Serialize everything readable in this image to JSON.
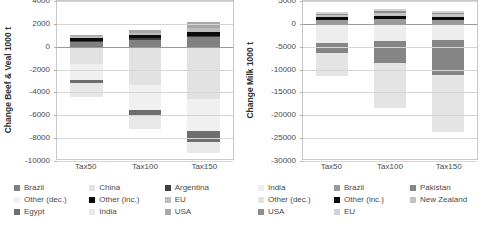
{
  "chart_data": [
    {
      "id": "beef-veal",
      "type": "bar",
      "stacked": true,
      "title": "",
      "xlabel": "",
      "ylabel": "Change Beef & Veal 1000 t",
      "categories": [
        "Tax50",
        "Tax100",
        "Tax150"
      ],
      "ylim": [
        -10000,
        4000
      ],
      "yticks": [
        4000,
        2000,
        0,
        -2000,
        -4000,
        -6000,
        -8000,
        -10000
      ],
      "grid": true,
      "legend_position": "bottom",
      "series": [
        {
          "name": "Brazil",
          "color": "#808080",
          "values": [
            400,
            620,
            840
          ]
        },
        {
          "name": "China",
          "color": "#e2e2e2",
          "values": [
            -1500,
            -3350,
            -4550
          ]
        },
        {
          "name": "Argentina",
          "color": "#3f3f3f",
          "values": [
            140,
            130,
            120
          ]
        },
        {
          "name": "Other (dec.)",
          "color": "#f0f0f0",
          "values": [
            -1450,
            -2150,
            -2850
          ]
        },
        {
          "name": "Other (inc.)",
          "color": "#0a0a0a",
          "values": [
            260,
            300,
            330
          ]
        },
        {
          "name": "EU",
          "color": "#bdbdbd",
          "values": [
            120,
            180,
            330
          ]
        },
        {
          "name": "Egypt",
          "color": "#6e6e6e",
          "values": [
            -200,
            -550,
            -950
          ]
        },
        {
          "name": "India",
          "color": "#e8e8e8",
          "values": [
            -1250,
            -1150,
            -950
          ]
        },
        {
          "name": "USA",
          "color": "#a8a8a8",
          "values": [
            80,
            220,
            550
          ]
        }
      ],
      "positive_order": [
        "Brazil",
        "Argentina",
        "Other (inc.)",
        "EU",
        "USA"
      ],
      "negative_order": [
        "China",
        "Other (dec.)",
        "Egypt",
        "India"
      ]
    },
    {
      "id": "milk",
      "type": "bar",
      "stacked": true,
      "title": "",
      "xlabel": "",
      "ylabel": "Change Milk 1000 t",
      "categories": [
        "Tax50",
        "Tax100",
        "Tax150"
      ],
      "ylim": [
        -30000,
        5000
      ],
      "yticks": [
        5000,
        0,
        -5000,
        -10000,
        -15000,
        -20000,
        -25000,
        -30000
      ],
      "grid": true,
      "legend_position": "bottom",
      "series": [
        {
          "name": "India",
          "color": "#ededed",
          "values": [
            -4100,
            -3750,
            -3550
          ]
        },
        {
          "name": "Brazil",
          "color": "#9a9a9a",
          "values": [
            750,
            1000,
            850
          ]
        },
        {
          "name": "Pakistan",
          "color": "#858585",
          "values": [
            -2250,
            -4900,
            -7600
          ]
        },
        {
          "name": "Other (dec.)",
          "color": "#e4e4e4",
          "values": [
            -5050,
            -9700,
            -12600
          ]
        },
        {
          "name": "Other (inc.)",
          "color": "#0a0a0a",
          "values": [
            700,
            800,
            750
          ]
        },
        {
          "name": "New Zealand",
          "color": "#c4c4c4",
          "values": [
            500,
            600,
            450
          ]
        },
        {
          "name": "USA",
          "color": "#8e8e8e",
          "values": [
            300,
            400,
            350
          ]
        },
        {
          "name": "EU",
          "color": "#d2d2d2",
          "values": [
            350,
            500,
            400
          ]
        }
      ],
      "positive_order": [
        "Brazil",
        "Other (inc.)",
        "New Zealand",
        "USA",
        "EU"
      ],
      "negative_order": [
        "India",
        "Pakistan",
        "Other (dec.)"
      ]
    }
  ]
}
